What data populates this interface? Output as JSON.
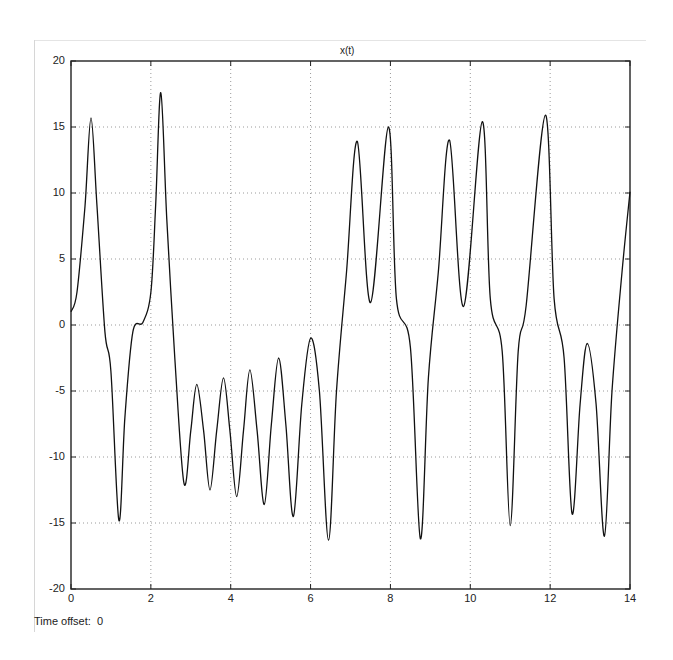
{
  "window": {
    "title": "x(t)",
    "time_offset_label": "Time offset:",
    "time_offset_value": "0"
  },
  "chart_data": {
    "type": "line",
    "title": "x(t)",
    "xlabel": "",
    "ylabel": "",
    "xlim": [
      0,
      14
    ],
    "ylim": [
      -20,
      20
    ],
    "grid": true,
    "xticks": [
      0,
      2,
      4,
      6,
      8,
      10,
      12,
      14
    ],
    "yticks": [
      -20,
      -15,
      -10,
      -5,
      0,
      5,
      10,
      15,
      20
    ],
    "series": [
      {
        "name": "x(t)",
        "color": "#111111",
        "x": [
          0,
          0.15,
          0.35,
          0.5,
          0.65,
          0.85,
          1.0,
          1.2,
          1.35,
          1.55,
          1.8,
          2.0,
          2.12,
          2.25,
          2.4,
          2.6,
          2.83,
          3.0,
          3.15,
          3.32,
          3.48,
          3.65,
          3.82,
          3.98,
          4.15,
          4.32,
          4.48,
          4.66,
          4.84,
          5.02,
          5.2,
          5.38,
          5.57,
          5.78,
          6.0,
          6.22,
          6.45,
          6.65,
          6.9,
          7.17,
          7.5,
          7.95,
          8.15,
          8.5,
          8.75,
          8.95,
          9.2,
          9.48,
          9.83,
          10.3,
          10.5,
          10.8,
          11.0,
          11.2,
          11.4,
          11.88,
          12.1,
          12.35,
          12.55,
          12.75,
          12.93,
          13.15,
          13.36,
          13.55,
          13.8,
          14.0
        ],
        "y": [
          1.0,
          2.5,
          9.0,
          15.7,
          9.0,
          -0.5,
          -3.5,
          -14.8,
          -7.0,
          -0.5,
          0.2,
          2.5,
          9.0,
          17.6,
          8.0,
          -2.5,
          -12.0,
          -8.0,
          -4.5,
          -8.0,
          -12.5,
          -8.0,
          -4.0,
          -8.0,
          -13.0,
          -8.0,
          -3.4,
          -8.0,
          -13.6,
          -7.5,
          -2.5,
          -7.5,
          -14.5,
          -6.0,
          -1.0,
          -5.0,
          -16.3,
          -5.0,
          4.0,
          13.9,
          1.7,
          15.0,
          2.0,
          -1.7,
          -16.2,
          -4.0,
          4.0,
          14.0,
          1.4,
          15.4,
          2.0,
          -2.0,
          -15.2,
          -2.0,
          1.5,
          15.9,
          2.0,
          -2.5,
          -14.3,
          -6.0,
          -1.4,
          -6.0,
          -16.0,
          -5.0,
          4.0,
          10.1
        ]
      }
    ]
  }
}
